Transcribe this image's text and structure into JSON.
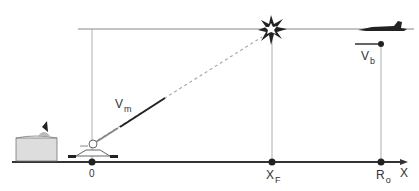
{
  "diagram": {
    "labels": {
      "vm": "V",
      "vm_sub": "m",
      "vb": "V",
      "vb_sub": "b",
      "origin": "0",
      "xf": "X",
      "xf_sub": "F",
      "ro": "R",
      "ro_sub": "o",
      "x_axis": "X"
    },
    "colors": {
      "line": "#333333",
      "thin_line": "#888888",
      "dashed": "#aaaaaa"
    }
  }
}
